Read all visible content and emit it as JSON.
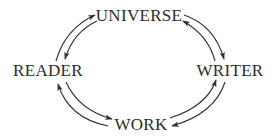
{
  "diagram": {
    "type": "cycle",
    "nodes": {
      "universe": {
        "label": "UNIVERSE"
      },
      "reader": {
        "label": "READER"
      },
      "writer": {
        "label": "WRITER"
      },
      "work": {
        "label": "WORK"
      }
    },
    "edges": [
      {
        "from": "READER",
        "to": "UNIVERSE"
      },
      {
        "from": "UNIVERSE",
        "to": "READER"
      },
      {
        "from": "UNIVERSE",
        "to": "WRITER"
      },
      {
        "from": "WRITER",
        "to": "UNIVERSE"
      },
      {
        "from": "WRITER",
        "to": "WORK"
      },
      {
        "from": "WORK",
        "to": "WRITER"
      },
      {
        "from": "WORK",
        "to": "READER"
      },
      {
        "from": "READER",
        "to": "WORK"
      }
    ],
    "colors": {
      "ink": "#2b2b2b",
      "background": "#ffffff"
    }
  }
}
